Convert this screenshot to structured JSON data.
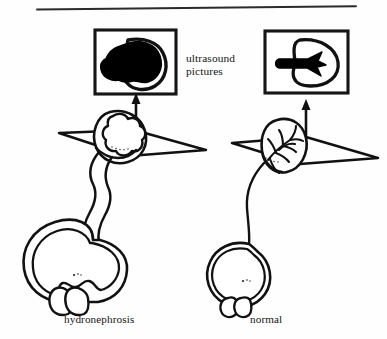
{
  "figure": {
    "title_rule": "horizontal-rule",
    "caption_left": "hydronephrosis",
    "caption_right": "normal",
    "callout_label": "ultrasound\npictures",
    "ink_color": "#111111",
    "paper_color": "#fefefe",
    "panels": [
      {
        "name": "hydronephrosis",
        "caption": "hydronephrosis",
        "ultrasound_frame": {
          "finding": "dilated fluid-filled collecting system",
          "fill": "#000000",
          "outline": "#111111"
        },
        "kidney": {
          "state": "dilated calyces",
          "outline": "#111111"
        },
        "scan_plane": {
          "shape": "parallelogram"
        },
        "arrow": {
          "direction": "up"
        },
        "ureter": {
          "state": "dilated tortuous"
        },
        "bladder": {
          "state": "distended thick-walled"
        }
      },
      {
        "name": "normal",
        "caption": "normal",
        "ultrasound_frame": {
          "finding": "normal central echo complex",
          "fill": "#000000",
          "outline": "#111111"
        },
        "kidney": {
          "state": "normal branching calyces",
          "outline": "#111111"
        },
        "scan_plane": {
          "shape": "parallelogram"
        },
        "arrow": {
          "direction": "up"
        },
        "ureter": {
          "state": "normal thin"
        },
        "bladder": {
          "state": "normal round"
        }
      }
    ]
  }
}
